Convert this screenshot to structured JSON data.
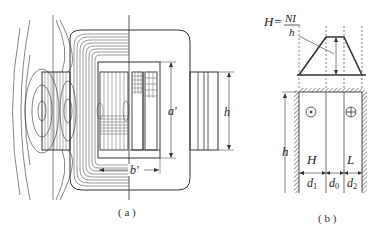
{
  "figure_a": {
    "caption": "( a )",
    "labels": {
      "window_height": "a'",
      "window_width": "b'",
      "winding_height": "h"
    }
  },
  "figure_b": {
    "caption": "( b )",
    "formula_lhs": "H=",
    "formula_num": "NI",
    "formula_den": "h",
    "height_label": "h",
    "winding_hv": "H",
    "winding_lv": "L",
    "dims": {
      "d1": "d",
      "d1_sub": "1",
      "d0": "d",
      "d0_sub": "0",
      "d2": "d",
      "d2_sub": "2"
    },
    "current_out_symbol": "dot-in-circle",
    "current_in_symbol": "cross-in-circle"
  },
  "colors": {
    "line": "#333333",
    "background": "#ffffff"
  }
}
